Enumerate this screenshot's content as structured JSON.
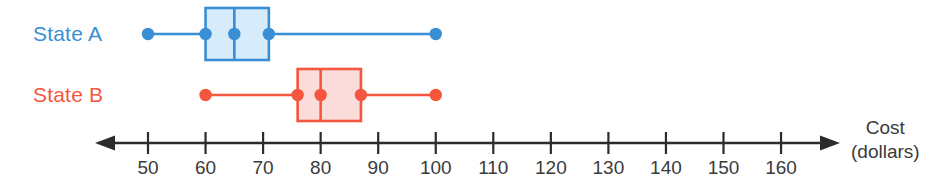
{
  "chart_data": {
    "type": "boxplot",
    "title": "",
    "xlabel": "Cost (dollars)",
    "ylabel": "",
    "orientation": "horizontal",
    "xlim": [
      45,
      165
    ],
    "grid": false,
    "legend": "none",
    "axis": {
      "label_line1": "Cost",
      "label_line2": "(dollars)",
      "tick_values": [
        50,
        60,
        70,
        80,
        90,
        100,
        110,
        120,
        130,
        140,
        150,
        160
      ],
      "tick_labels": [
        "50",
        "60",
        "70",
        "80",
        "90",
        "100",
        "110",
        "120",
        "130",
        "140",
        "150",
        "160"
      ],
      "tick_step": 10,
      "arrow_left": true,
      "arrow_right": true,
      "color": "#2b2b2b"
    },
    "series": [
      {
        "name": "State A",
        "label": "State A",
        "color": "#3a8fd4",
        "fill": "#d7ecfa",
        "min": 50,
        "q1": 60,
        "median": 65,
        "q3": 71,
        "max": 100
      },
      {
        "name": "State B",
        "label": "State B",
        "color": "#f4573d",
        "fill": "#fbdcda",
        "min": 60,
        "q1": 76,
        "median": 80,
        "q3": 87,
        "max": 100
      }
    ]
  },
  "colors": {
    "state_a": "#3a8fd4",
    "state_a_fill": "#d7ecfa",
    "state_b": "#f4573d",
    "state_b_fill": "#fbdcda",
    "axis": "#2b2b2b",
    "text": "#3b3b3b",
    "background": "#ffffff"
  }
}
